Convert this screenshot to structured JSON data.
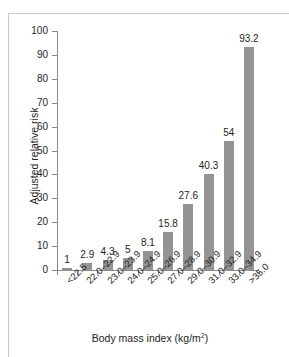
{
  "chart_data": {
    "type": "bar",
    "title": "",
    "subtitle": "",
    "xlabel": "Body mass index (kg/m²)",
    "xlabel_base": "Body mass index (kg/m",
    "xlabel_sup": "2",
    "xlabel_tail": ")",
    "ylabel": "Adjusted relative risk",
    "ylim": [
      0,
      100
    ],
    "ytick_step": 10,
    "yticks": [
      0,
      10,
      20,
      30,
      40,
      50,
      60,
      70,
      80,
      90,
      100
    ],
    "ytick_labels": [
      "0",
      "10",
      "20",
      "30",
      "40",
      "50",
      "60",
      "70",
      "80",
      "90",
      "100"
    ],
    "grid": false,
    "legend": null,
    "legend_position": "none",
    "categories": [
      "<22.5",
      "22.0–22.9",
      "23.0–23.9",
      "24.0–24.9",
      "25.0–26.9",
      "27.0–28.9",
      "29.0–30.9",
      "31.0–32.9",
      "33.0–34.9",
      ">35.0"
    ],
    "values": [
      1,
      2.9,
      4.3,
      5,
      8.1,
      15.8,
      27.6,
      40.3,
      54,
      93.2
    ],
    "value_labels": [
      "1",
      "2.9",
      "4.3",
      "5",
      "8.1",
      "15.8",
      "27.6",
      "40.3",
      "54",
      "93.2"
    ],
    "bar_color": "#949494",
    "axis_color": "#8c8c8c",
    "text_color": "#231f20",
    "frame_color": "#c9c9c9",
    "background_color": "#ffffff"
  }
}
